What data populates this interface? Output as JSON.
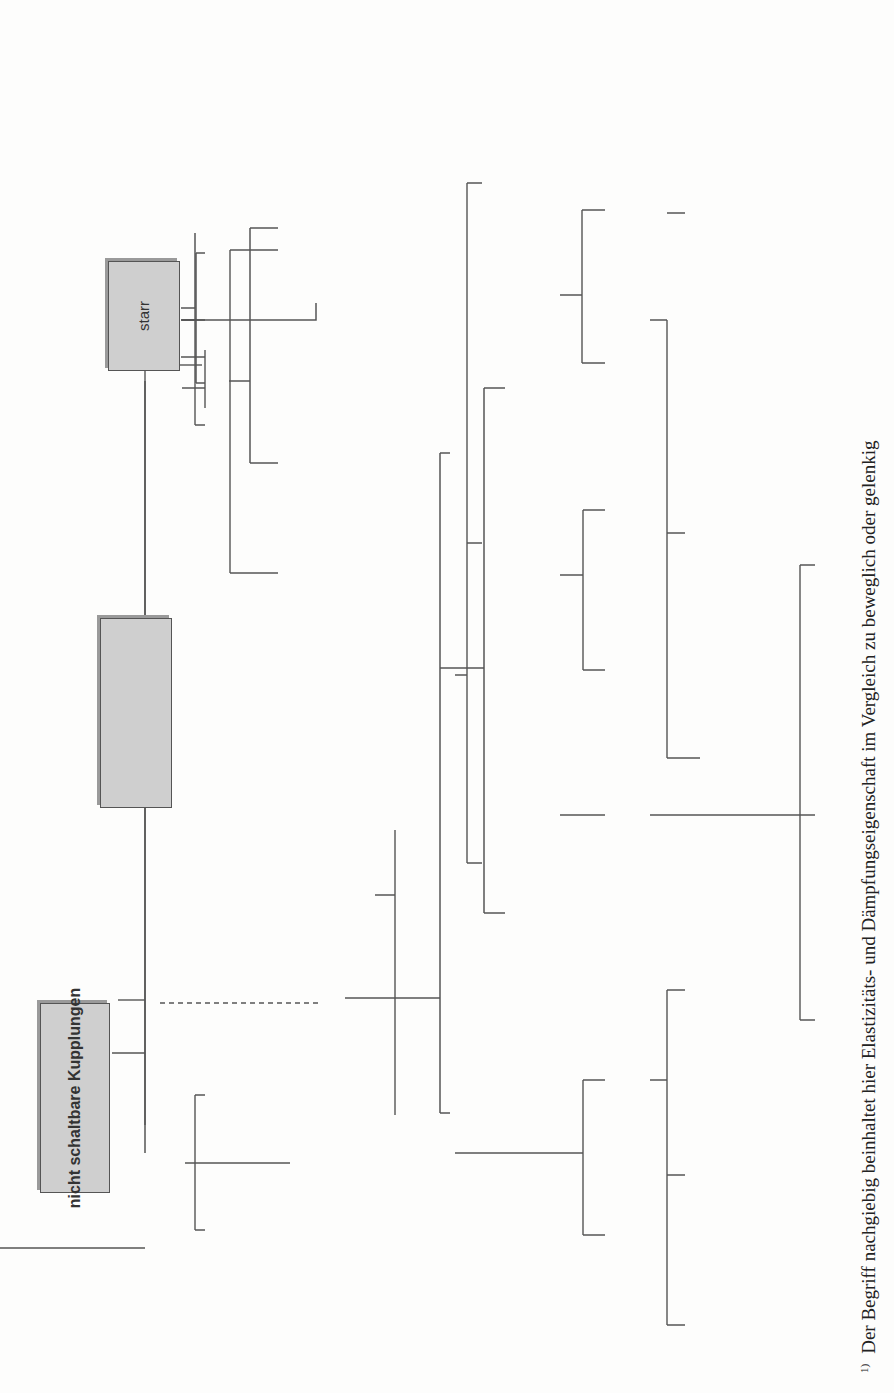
{
  "diagram": {
    "roots": {
      "non_switchable": "nicht schaltbare Kupplungen",
      "switchable": "schaltbare Kupplungen"
    },
    "non_switchable": {
      "rigid": {
        "label": "starr",
        "children": [
          [
            "form-",
            "schlüssig"
          ],
          [
            "kraft-",
            "schlüssig"
          ],
          [
            "form- und",
            "kraftschlüssig"
          ]
        ]
      },
      "flexible": {
        "label": [
          "beweglich",
          "nachgiebig, elastisch",
          "(Ausgleichskuppl.)"
        ],
        "footnote_ref": "1)",
        "child": [
          "form-",
          "schlüssig"
        ],
        "variant_a": {
          "ref": "a) 2)",
          "segments": [
            "längs-",
            "quer-",
            "winkel-",
            "dreh-"
          ],
          "caption": "beweglich, gelenkig"
        },
        "variant_b": {
          "ref": "b) 2)",
          "segments": [
            "längs-",
            "quer-",
            "winkel-",
            "dreh-"
          ],
          "caption": "nachgiebig, elastisch"
        }
      }
    },
    "link_ref": "3)",
    "switchable": {
      "externally": {
        "label": [
          "fremdbetätigt",
          "(Schaltkuppl.)"
        ],
        "form": "formschlüssig",
        "force": "kraftschlüssig",
        "force_children": {
          "friction": "reibschlüssig",
          "magnetic": "magnetisch",
          "hydro": [
            "hydrostatisch",
            "oder -dynamisch"
          ],
          "electro": [
            "elektrostatisch",
            "oder -dynamisch"
          ]
        }
      },
      "self": {
        "label": "selbstbetätigt",
        "speed": {
          "label": [
            "drehfrequenzbetätigt",
            "(Fliehkraftkuppl.)"
          ],
          "force": "kraftschlüssig",
          "children": {
            "friction": "reibschlüssig",
            "hydrodynamic": "hydrodynamisch",
            "electrodynamic": "elektrodynamisch"
          }
        },
        "torque": {
          "label": [
            "momentbetätigt",
            "(Sicherheitskuppl.)"
          ],
          "form": "formschlüssig",
          "force": "kraftschlüssig",
          "force_children": {
            "friction": "reibschlüssig",
            "magnetic": "magnetisch",
            "hydro": [
              "hydrostatisch",
              "oder -dynamisch"
            ],
            "electro": [
              "elektrostatisch",
              "oder -dynamisch"
            ]
          }
        },
        "direction": {
          "label": [
            "richtungsbetätigt",
            "(Freilaufkuppl.)"
          ],
          "form": "formschlüssig",
          "force": "kraftschlüssig"
        }
      }
    },
    "footnote": {
      "marker": "1)",
      "text": "Der Begriff nachgiebig beinhaltet hier Elastizitäts- und Dämpfungseigenschaft im Vergleich zu beweglich oder gelenkig"
    },
    "symbols": [
      "rigid-coupling-symbol",
      "flexible-coupling-symbol",
      "non-switchable-coupling-symbol",
      "switchable-coupling-symbol",
      "external-clutch-symbol",
      "centrifugal-clutch-symbol",
      "safety-clutch-symbol",
      "freewheel-clutch-symbol"
    ]
  }
}
